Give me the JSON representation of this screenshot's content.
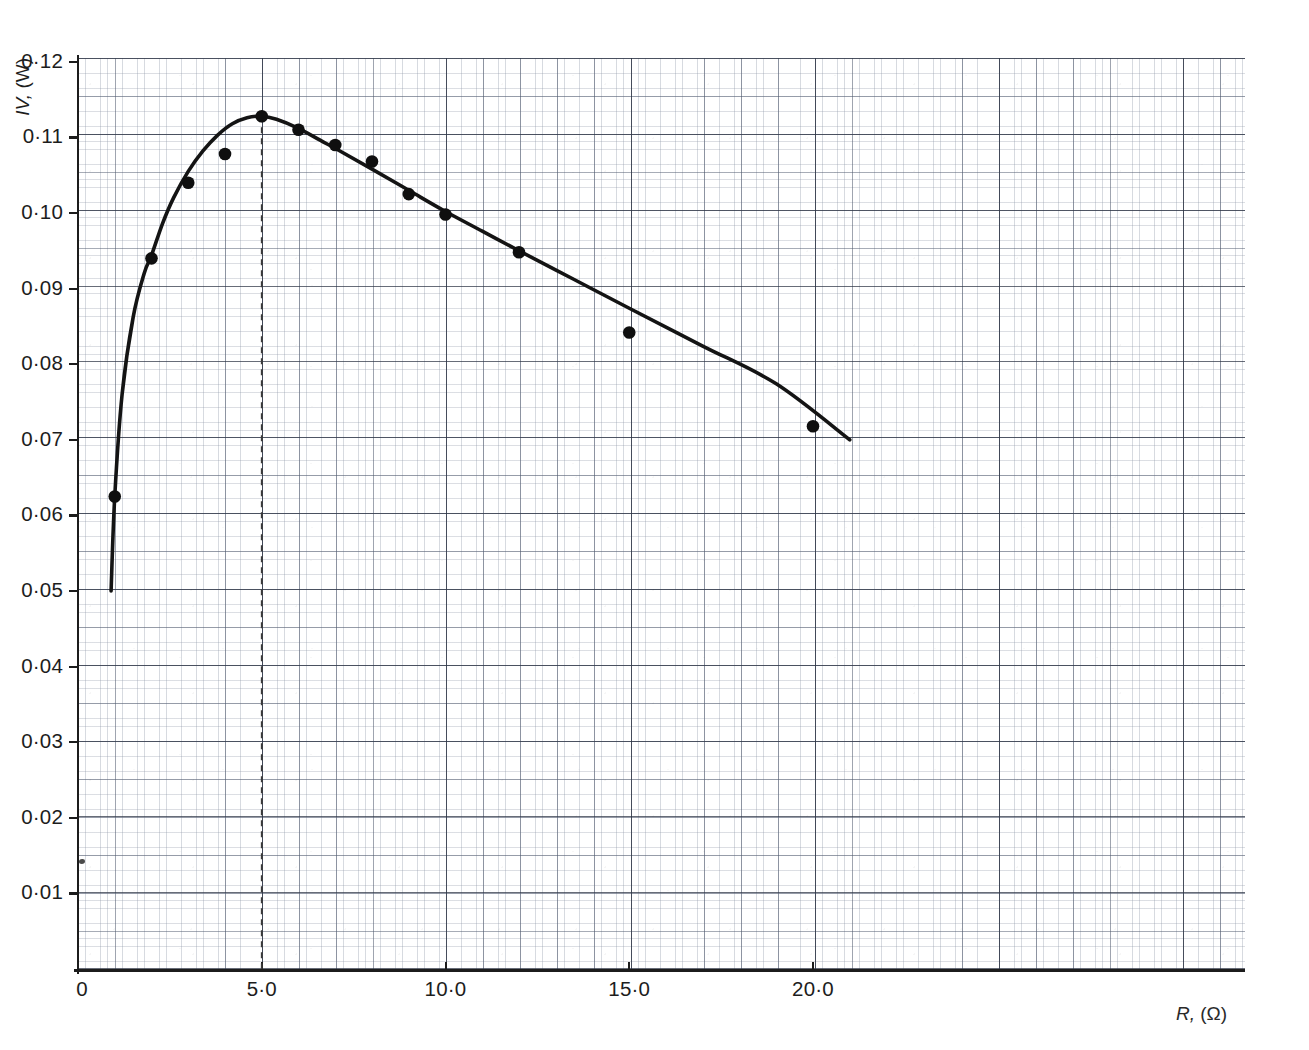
{
  "figure": {
    "background_color": "#ffffff",
    "ink_color": "#1c1c1c",
    "grid_color": "#7a849a",
    "media": "printed-graph-paper-scan"
  },
  "axes": {
    "y_title": "IV,",
    "y_unit": "(W)",
    "x_title": "R,",
    "x_unit": "(Ω)",
    "y_ticks": [
      "0·12",
      "0·11",
      "0·10",
      "0·09",
      "0·08",
      "0·07",
      "0·06",
      "0·05",
      "0·04",
      "0·03",
      "0·02",
      "0·01"
    ],
    "x_ticks": [
      "0",
      "5·0",
      "10·0",
      "15·0",
      "20·0"
    ]
  },
  "annotations": {
    "peak_marker_label": "dashed vertical line at R = 5·0",
    "stray_ink_label": "stray ink mark near origin"
  },
  "chart_data": {
    "type": "scatter",
    "title": "",
    "subtitle": "",
    "xlabel": "R, (Ω)",
    "ylabel": "IV, (W)",
    "xlim": [
      0,
      31.7
    ],
    "ylim": [
      0,
      0.1205
    ],
    "xticks": [
      0,
      5,
      10,
      15,
      20
    ],
    "xticklabels": [
      "0",
      "5·0",
      "10·0",
      "15·0",
      "20·0"
    ],
    "yticks": [
      0.01,
      0.02,
      0.03,
      0.04,
      0.05,
      0.06,
      0.07,
      0.08,
      0.09,
      0.1,
      0.11,
      0.12
    ],
    "yticklabels": [
      "0·01",
      "0·02",
      "0·03",
      "0·04",
      "0·05",
      "0·06",
      "0·07",
      "0·08",
      "0·09",
      "0·10",
      "0·11",
      "0·12"
    ],
    "grid": true,
    "legend": false,
    "decimal_separator": "·",
    "series": [
      {
        "name": "measured points",
        "marker": "filled-circle",
        "x": [
          1.0,
          2.0,
          3.0,
          4.0,
          5.0,
          6.0,
          7.0,
          8.0,
          9.0,
          10.0,
          12.0,
          15.0,
          20.0
        ],
        "y": [
          0.0625,
          0.094,
          0.104,
          0.1078,
          0.1128,
          0.111,
          0.109,
          0.1068,
          0.1025,
          0.0998,
          0.0948,
          0.0842,
          0.0718
        ]
      },
      {
        "name": "fitted curve",
        "marker": "none",
        "line": "solid",
        "x": [
          0.9,
          1.0,
          1.2,
          1.5,
          1.8,
          2.0,
          2.3,
          2.6,
          3.0,
          3.4,
          3.8,
          4.2,
          4.6,
          5.0,
          5.4,
          6.0,
          6.6,
          7.2,
          8.0,
          9.0,
          10.0,
          11.0,
          12.0,
          13.5,
          15.0,
          17.0,
          19.0,
          21.0
        ],
        "y": [
          0.05,
          0.0625,
          0.076,
          0.0862,
          0.092,
          0.0944,
          0.0986,
          0.102,
          0.1055,
          0.1082,
          0.1103,
          0.1118,
          0.1126,
          0.1128,
          0.1124,
          0.1112,
          0.1096,
          0.108,
          0.1058,
          0.103,
          0.1002,
          0.0976,
          0.095,
          0.0912,
          0.0874,
          0.0824,
          0.0774,
          0.07
        ]
      }
    ],
    "peak": {
      "x": 5.0,
      "y": 0.1128,
      "marker_line": "dashed"
    }
  }
}
